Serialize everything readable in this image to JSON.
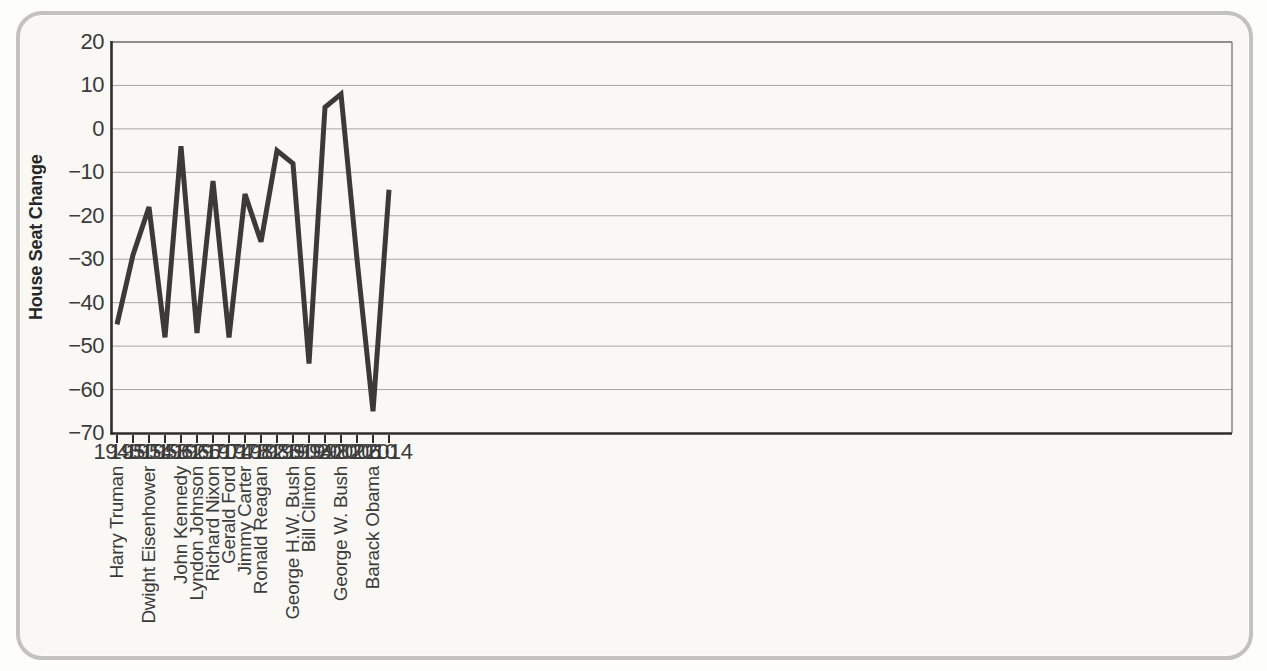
{
  "page": {
    "background": "#fdfdfc"
  },
  "card": {
    "background": "#f9f8f5",
    "border_color": "#c3c2bf"
  },
  "chart_data": {
    "type": "line",
    "title": "",
    "xlabel": "",
    "ylabel": "House Seat Change",
    "x": [
      1946,
      1950,
      1954,
      1958,
      1962,
      1966,
      1970,
      1974,
      1978,
      1982,
      1986,
      1990,
      1994,
      1998,
      2002,
      2006,
      2010,
      2014
    ],
    "values": [
      -45,
      -29,
      -18,
      -48,
      -4,
      -47,
      -12,
      -48,
      -15,
      -26,
      -5,
      -8,
      -54,
      5,
      8,
      -30,
      -65,
      -14
    ],
    "series_name": "House seat change for the president's party in midterm elections",
    "presidents": [
      {
        "year": 1946,
        "name": "Harry Truman"
      },
      {
        "year": 1954,
        "name": "Dwight Eisenhower"
      },
      {
        "year": 1962,
        "name": "John Kennedy"
      },
      {
        "year": 1966,
        "name": "Lyndon Johnson"
      },
      {
        "year": 1970,
        "name": "Richard Nixon"
      },
      {
        "year": 1974,
        "name": "Gerald Ford"
      },
      {
        "year": 1978,
        "name": "Jimmy Carter"
      },
      {
        "year": 1982,
        "name": "Ronald Reagan"
      },
      {
        "year": 1990,
        "name": "George H.W. Bush"
      },
      {
        "year": 1994,
        "name": "Bill Clinton"
      },
      {
        "year": 2002,
        "name": "George W. Bush"
      },
      {
        "year": 2010,
        "name": "Barack Obama"
      }
    ],
    "y_ticks": [
      20,
      10,
      0,
      -10,
      -20,
      -30,
      -40,
      -50,
      -60,
      -70
    ],
    "ylim": [
      -70,
      20
    ],
    "xlim": [
      1946,
      2014
    ],
    "grid": true,
    "legend": "none",
    "line_color": "#3b3a38",
    "grid_color": "#a8a7a4",
    "axis_color": "#2e2d2b",
    "text_color": "#3b3b3b"
  }
}
